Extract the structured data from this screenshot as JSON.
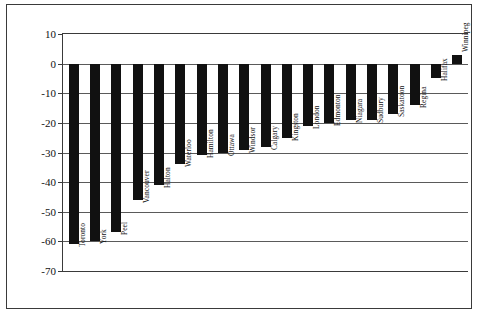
{
  "chart_data": {
    "type": "bar",
    "title": "",
    "xlabel": "",
    "ylabel": "Changes in Rents vs. Incomes",
    "ylim": [
      -70,
      10
    ],
    "ytick_step": 10,
    "yticks": [
      10,
      0,
      -10,
      -20,
      -30,
      -40,
      -50,
      -60,
      -70
    ],
    "ytick_labels": [
      "10",
      "0",
      "-10",
      "-20",
      "-30",
      "-40",
      "-50",
      "-60",
      "-70"
    ],
    "grid": true,
    "legend": false,
    "bar_color": "#111111",
    "axis_color": "#3a3a3a",
    "categories": [
      "Toronto",
      "York",
      "Peel",
      "Vancouver",
      "Halton",
      "Waterloo",
      "Hamilton",
      "Ottawa",
      "Windsor",
      "Calgary",
      "Kingston",
      "London",
      "Edmonton",
      "Niagara",
      "Sudbury",
      "Saskatoon",
      "Regina",
      "Halifax",
      "Winnipeg"
    ],
    "values": [
      -61,
      -60,
      -57,
      -46,
      -41,
      -34,
      -31,
      -30,
      -29,
      -28,
      -25,
      -21,
      -20,
      -19,
      -19,
      -17,
      -14,
      -5,
      3
    ]
  }
}
